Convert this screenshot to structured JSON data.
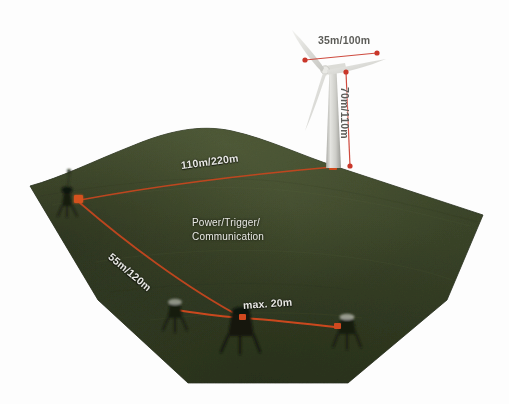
{
  "diagram": {
    "background_color": "#fdfdfd",
    "terrain": {
      "name": "hill-terrain",
      "fill_top": "#434d2e",
      "fill_mid": "#3b4529",
      "fill_bottom": "#333c22",
      "edge_color": "#2b3320"
    },
    "cable_color": "#c4461f",
    "node_color": "#d4521e",
    "marker_color": "#d12b16",
    "tower_color": "#cfcfcb",
    "blade_color": "#e2e2de",
    "label_color": "#e8e8e4",
    "turbine": {
      "name": "wind-turbine",
      "rotor_label": "35m/100m",
      "hub_label": "70m/110m"
    },
    "labels": {
      "cable_long": "110m/220m",
      "cable_mid": "55m/120m",
      "cable_short": "max. 20m",
      "function_line1": "Power/Trigger/",
      "function_line2": "Communication"
    },
    "nodes": [
      {
        "name": "junction-box",
        "x": 78,
        "y": 200
      },
      {
        "name": "turbine-base-node",
        "x": 333,
        "y": 166
      },
      {
        "name": "sensor-node-center",
        "x": 243,
        "y": 318
      },
      {
        "name": "sensor-node-right",
        "x": 338,
        "y": 327
      }
    ],
    "equipment": [
      {
        "name": "equipment-unit-left",
        "x": 72,
        "y": 203
      },
      {
        "name": "equipment-unit-a",
        "x": 175,
        "y": 313
      },
      {
        "name": "equipment-unit-b",
        "x": 240,
        "y": 330
      },
      {
        "name": "equipment-unit-c",
        "x": 347,
        "y": 330
      }
    ]
  }
}
